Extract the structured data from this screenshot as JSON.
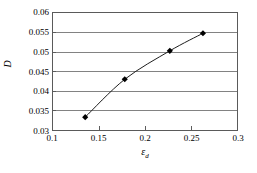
{
  "chart_data": {
    "type": "line",
    "title": "",
    "xlabel": "ε",
    "xlabel_sub": "d",
    "ylabel": "D",
    "xlim": [
      0.1,
      0.3
    ],
    "ylim": [
      0.03,
      0.06
    ],
    "xticks": [
      "0.1",
      "0.15",
      "0.2",
      "0.25",
      "0.3"
    ],
    "xtick_values": [
      0.1,
      0.15,
      0.2,
      0.25,
      0.3
    ],
    "yticks": [
      "0.06",
      "0.055",
      "0.05",
      "0.045",
      "0.04",
      "0.035",
      "0.03"
    ],
    "ytick_values": [
      0.06,
      0.055,
      0.05,
      0.045,
      0.04,
      0.035,
      0.03
    ],
    "grid": "horizontal",
    "legend": "none",
    "marker": "diamond",
    "series": [
      {
        "name": "D",
        "x": [
          0.135,
          0.178,
          0.227,
          0.263
        ],
        "values": [
          0.0333,
          0.043,
          0.0503,
          0.0548
        ]
      }
    ]
  },
  "style": {
    "line_color": "#1a1a1a",
    "marker_color": "#000000",
    "grid_color": "#808080",
    "frame_color": "#5a5a5a",
    "background": "#ffffff"
  }
}
